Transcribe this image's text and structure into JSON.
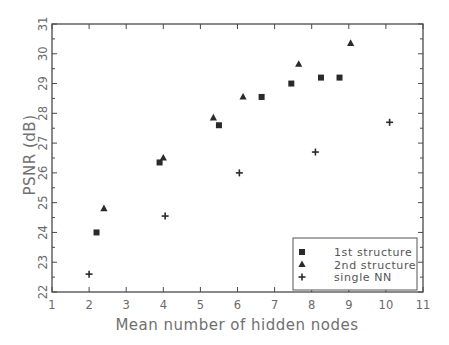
{
  "chart_data": {
    "type": "scatter",
    "title": "",
    "xlabel": "Mean number of hidden nodes",
    "ylabel": "PSNR (dB)",
    "xlim": [
      1,
      11
    ],
    "ylim": [
      22,
      31
    ],
    "x_ticks": [
      1,
      2,
      3,
      4,
      5,
      6,
      7,
      8,
      9,
      10,
      11
    ],
    "y_ticks": [
      22,
      23,
      24,
      25,
      26,
      27,
      28,
      29,
      30,
      31
    ],
    "grid": false,
    "legend_position": "lower right",
    "series": [
      {
        "name": "1st structure",
        "marker": "square",
        "points": [
          [
            2.2,
            24.0
          ],
          [
            3.9,
            26.35
          ],
          [
            5.5,
            27.6
          ],
          [
            6.65,
            28.55
          ],
          [
            7.45,
            29.0
          ],
          [
            8.25,
            29.2
          ],
          [
            8.75,
            29.2
          ]
        ]
      },
      {
        "name": "2nd structure",
        "marker": "triangle",
        "points": [
          [
            2.4,
            24.8
          ],
          [
            4.0,
            26.5
          ],
          [
            5.35,
            27.85
          ],
          [
            6.15,
            28.55
          ],
          [
            7.65,
            29.65
          ],
          [
            9.05,
            30.35
          ]
        ]
      },
      {
        "name": "single NN",
        "marker": "plus",
        "points": [
          [
            2.0,
            22.6
          ],
          [
            4.05,
            24.55
          ],
          [
            6.05,
            26.0
          ],
          [
            8.1,
            26.7
          ],
          [
            10.1,
            27.7
          ]
        ]
      }
    ]
  },
  "colors": {
    "axis": "#4a4a4a",
    "marker": "#2a2a2a",
    "text": "#6a6a6a",
    "background": "#ffffff"
  }
}
